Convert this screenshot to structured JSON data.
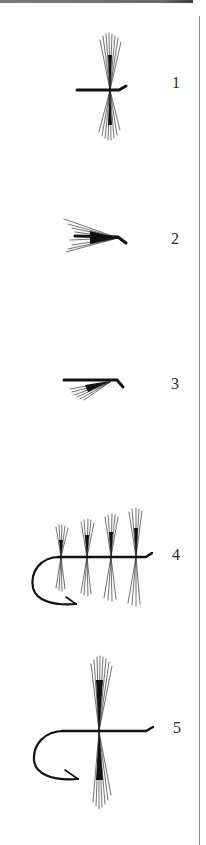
{
  "plate": {
    "description": "Five fly-tying diagrams (hackle and hook illustrations) with numbered labels",
    "ink_color": "#111111",
    "rule_color": "#8a8a8a",
    "top_rule_color": "#6a6a6a"
  },
  "figures": [
    {
      "number": "1",
      "label": "1",
      "subject": "hackle wound on straight shank with up-eye"
    },
    {
      "number": "2",
      "label": "2",
      "subject": "swept-back hackle fibres on shank with down-eye"
    },
    {
      "number": "3",
      "label": "3",
      "subject": "shank with fibres swept back and down"
    },
    {
      "number": "4",
      "label": "4",
      "subject": "hook with four hackle bunches increasing in length"
    },
    {
      "number": "5",
      "label": "5",
      "subject": "hook with single long hackle wound at mid-shank"
    }
  ]
}
